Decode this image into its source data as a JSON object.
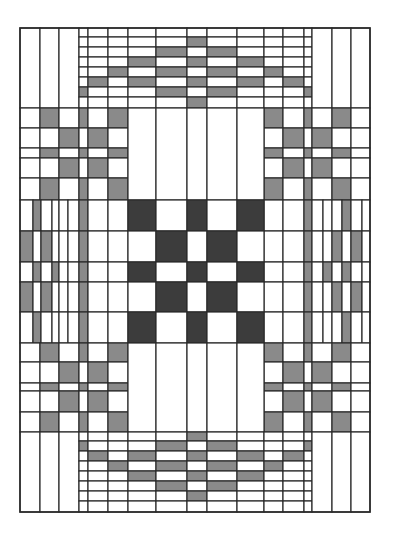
{
  "diagram": {
    "title": "",
    "colors": {
      "background": "#ffffff",
      "light": "#ffffff",
      "medium": "#8a8a8a",
      "dark": "#3c3c3c",
      "line": "#2a2a2a"
    },
    "frame": {
      "x": 20,
      "y": 28,
      "width": 350,
      "height": 484
    },
    "cols": [
      20,
      40,
      59,
      79,
      88,
      108,
      128,
      156,
      187,
      207,
      237,
      264,
      283,
      304,
      312,
      332,
      351,
      370
    ],
    "bands": [
      {
        "name": "top-band",
        "y": [
          28,
          37,
          47,
          57,
          67,
          77,
          87,
          97,
          108
        ],
        "cols": [
          20,
          40,
          59,
          79,
          88,
          108,
          128,
          156,
          187,
          207,
          237,
          264,
          283,
          304,
          312,
          332,
          351,
          370
        ],
        "merge_full_height_cols": [
          0,
          1,
          2,
          14,
          15,
          16
        ],
        "fills": {
          "8": [
            "",
            "m",
            "",
            "m",
            "",
            "m",
            "",
            "m"
          ],
          "7": [
            "",
            "",
            "m",
            "",
            "m",
            "",
            "m",
            ""
          ],
          "9": [
            "",
            "",
            "m",
            "",
            "m",
            "",
            "m",
            ""
          ],
          "6": [
            "",
            "",
            "",
            "m",
            "",
            "m",
            "",
            ""
          ],
          "10": [
            "",
            "",
            "",
            "m",
            "",
            "m",
            "",
            ""
          ],
          "5": [
            "",
            "",
            "",
            "",
            "m",
            "",
            "",
            ""
          ],
          "11": [
            "",
            "",
            "",
            "",
            "m",
            "",
            "",
            ""
          ],
          "4": [
            "",
            "",
            "",
            "",
            "",
            "m",
            "",
            ""
          ],
          "12": [
            "",
            "",
            "",
            "",
            "",
            "m",
            "",
            ""
          ],
          "3": [
            "",
            "",
            "",
            "",
            "",
            "",
            "m",
            ""
          ],
          "13": [
            "",
            "",
            "",
            "",
            "",
            "",
            "m",
            ""
          ]
        }
      },
      {
        "name": "upper-block",
        "y": [
          108,
          128,
          148,
          158,
          178,
          200
        ],
        "left_cols": [
          20,
          40,
          59,
          79,
          88,
          108,
          128
        ],
        "right_cols": [
          264,
          283,
          304,
          312,
          332,
          351,
          370
        ],
        "left_fills": [
          [
            "",
            "m",
            "",
            "m",
            "",
            "m"
          ],
          [
            "",
            "",
            "m",
            "",
            "m",
            ""
          ],
          [
            "",
            "m",
            "",
            "m",
            "",
            "m"
          ],
          [
            "",
            "",
            "m",
            "",
            "m",
            ""
          ],
          [
            "",
            "m",
            "",
            "m",
            "",
            "m"
          ]
        ],
        "right_fills": [
          [
            "m",
            "",
            "m",
            "",
            "m",
            ""
          ],
          [
            "",
            "m",
            "",
            "m",
            "",
            ""
          ],
          [
            "m",
            "",
            "m",
            "",
            "m",
            ""
          ],
          [
            "",
            "m",
            "",
            "m",
            "",
            ""
          ],
          [
            "m",
            "",
            "m",
            "",
            "m",
            ""
          ]
        ],
        "center_cols": [
          128,
          156,
          187,
          207,
          237,
          264
        ],
        "center_fills": [
          "",
          "",
          "",
          "",
          ""
        ]
      },
      {
        "name": "middle-band",
        "y": [
          200,
          231,
          262,
          282,
          312,
          343
        ],
        "left_cols": [
          20,
          33,
          41,
          52,
          59,
          68,
          79,
          88,
          108,
          128
        ],
        "right_cols": [
          264,
          283,
          304,
          312,
          323,
          332,
          342,
          351,
          362,
          370
        ],
        "left_fills": [
          [
            "",
            "m",
            "",
            "",
            "",
            "",
            "m",
            "",
            ""
          ],
          [
            "m",
            "",
            "m",
            "",
            "",
            "",
            "m",
            "",
            ""
          ],
          [
            "",
            "m",
            "",
            "m",
            "",
            "",
            "m",
            "",
            ""
          ],
          [
            "m",
            "",
            "m",
            "",
            "",
            "",
            "m",
            "",
            ""
          ],
          [
            "",
            "m",
            "",
            "",
            "",
            "",
            "m",
            "",
            ""
          ]
        ],
        "right_fills": [
          [
            "",
            "",
            "m",
            "",
            "",
            "",
            "m",
            "",
            ""
          ],
          [
            "",
            "",
            "m",
            "",
            "",
            "m",
            "",
            "m",
            ""
          ],
          [
            "",
            "",
            "m",
            "",
            "m",
            "",
            "m",
            "",
            ""
          ],
          [
            "",
            "",
            "m",
            "",
            "",
            "m",
            "",
            "m",
            ""
          ],
          [
            "",
            "",
            "m",
            "",
            "",
            "",
            "m",
            "",
            ""
          ]
        ],
        "center_cols": [
          128,
          156,
          187,
          207,
          237,
          264
        ],
        "center_fills": [
          [
            "d",
            "",
            "d",
            "",
            "d"
          ],
          [
            "",
            "d",
            "",
            "d",
            ""
          ],
          [
            "d",
            "",
            "d",
            "",
            "d"
          ],
          [
            "",
            "d",
            "",
            "d",
            ""
          ],
          [
            "d",
            "",
            "d",
            "",
            "d"
          ]
        ]
      },
      {
        "name": "lower-block",
        "y": [
          343,
          362,
          383,
          391,
          412,
          432
        ],
        "left_cols": [
          20,
          40,
          59,
          79,
          88,
          108,
          128
        ],
        "right_cols": [
          264,
          283,
          304,
          312,
          332,
          351,
          370
        ],
        "left_fills": [
          [
            "",
            "m",
            "",
            "m",
            "",
            "m"
          ],
          [
            "",
            "",
            "m",
            "",
            "m",
            ""
          ],
          [
            "",
            "m",
            "",
            "m",
            "",
            "m"
          ],
          [
            "",
            "",
            "m",
            "",
            "m",
            ""
          ],
          [
            "",
            "m",
            "",
            "m",
            "",
            "m"
          ]
        ],
        "right_fills": [
          [
            "m",
            "",
            "m",
            "",
            "m",
            ""
          ],
          [
            "",
            "m",
            "",
            "m",
            "",
            ""
          ],
          [
            "m",
            "",
            "m",
            "",
            "m",
            ""
          ],
          [
            "",
            "m",
            "",
            "m",
            "",
            ""
          ],
          [
            "m",
            "",
            "m",
            "",
            "m",
            ""
          ]
        ],
        "center_cols": [
          128,
          156,
          187,
          207,
          237,
          264
        ],
        "center_fills": [
          "",
          "",
          "",
          "",
          ""
        ]
      },
      {
        "name": "bottom-band",
        "y": [
          432,
          441,
          451,
          461,
          471,
          481,
          491,
          501,
          512
        ],
        "cols": [
          20,
          40,
          59,
          79,
          88,
          108,
          128,
          156,
          187,
          207,
          237,
          264,
          283,
          304,
          312,
          332,
          351,
          370
        ],
        "merge_full_height_cols": [
          0,
          1,
          2,
          14,
          15,
          16
        ],
        "fills": {
          "8": [
            "m",
            "",
            "m",
            "",
            "m",
            "",
            "m",
            ""
          ],
          "7": [
            "",
            "m",
            "",
            "m",
            "",
            "m",
            "",
            ""
          ],
          "9": [
            "",
            "m",
            "",
            "m",
            "",
            "m",
            "",
            ""
          ],
          "6": [
            "",
            "",
            "m",
            "",
            "m",
            "",
            "",
            ""
          ],
          "10": [
            "",
            "",
            "m",
            "",
            "m",
            "",
            "",
            ""
          ],
          "5": [
            "",
            "",
            "",
            "m",
            "",
            "",
            "",
            ""
          ],
          "11": [
            "",
            "",
            "",
            "m",
            "",
            "",
            "",
            ""
          ],
          "4": [
            "",
            "",
            "m",
            "",
            "",
            "",
            "",
            ""
          ],
          "12": [
            "",
            "",
            "m",
            "",
            "",
            "",
            "",
            ""
          ],
          "3": [
            "",
            "m",
            "",
            "",
            "",
            "",
            "",
            ""
          ],
          "13": [
            "",
            "m",
            "",
            "",
            "",
            "",
            "",
            ""
          ]
        }
      }
    ]
  }
}
